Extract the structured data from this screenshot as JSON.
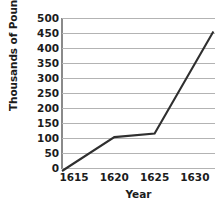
{
  "chart_data": {
    "type": "line",
    "title": "",
    "xlabel": "Year",
    "ylabel": "Thousands of Pounds",
    "xlim": [
      1613.5,
      1632.5
    ],
    "ylim": [
      0,
      500
    ],
    "grid": true,
    "legend": "none",
    "y_ticks": [
      500,
      450,
      400,
      350,
      300,
      250,
      200,
      150,
      100,
      50,
      0
    ],
    "x_ticks": [
      1615,
      1620,
      1625,
      1630
    ],
    "series": [
      {
        "name": "Tobacco exported",
        "color": "#2f2f2f",
        "x": [
          1613.5,
          1620,
          1625,
          1632.3
        ],
        "values": [
          -10,
          103,
          115,
          455
        ]
      }
    ]
  },
  "axes": {
    "y_title": "Thousands of Pounds",
    "x_title": "Year",
    "y_tick_labels": [
      "500",
      "450",
      "400",
      "350",
      "300",
      "250",
      "200",
      "150",
      "100",
      "50",
      "0"
    ],
    "x_tick_labels": [
      "1615",
      "1620",
      "1625",
      "1630"
    ]
  },
  "colors": {
    "line": "#2f2f2f",
    "grid": "#b3b3b3",
    "axis": "#8a8a8a",
    "text": "#1c1c1c",
    "background": "#ffffff"
  }
}
